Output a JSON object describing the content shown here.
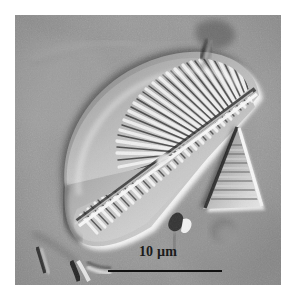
{
  "figure": {
    "kind": "light-microscopy-micrograph",
    "technique": "differential-interference-contrast",
    "width_px": 292,
    "height_px": 298,
    "background_color": "#ffffff",
    "field": {
      "left_px": 15,
      "top_px": 15,
      "width_px": 266,
      "height_px": 270,
      "base_gray": "#969696",
      "highlight_color": "#f2f2f2",
      "shadow_color": "#242424"
    }
  },
  "scalebar": {
    "label": "10 µm",
    "value": 10,
    "unit": "µm",
    "line_length_px": 114,
    "line_thickness_px": 2,
    "line_color": "#111111",
    "text_color": "#1b1b1b"
  },
  "specimens": [
    {
      "name": "primary-diatom-valve",
      "description": "Large triangular to lunate diatom valve in oblique view with radiating transapical striae",
      "striae_upper_count": 30,
      "striae_lower_count": 30,
      "features": [
        "raphe-sternum",
        "transapical-striae",
        "silica-rim",
        "apical-axis"
      ]
    },
    {
      "name": "secondary-diatom-fragment",
      "description": "Smaller triangular diatom fragment at right of field",
      "striae_count": 10
    }
  ],
  "debris": [
    {
      "name": "debris-top-blob",
      "description": "Dark irregular aggregate at top of field"
    },
    {
      "name": "debris-lower-left",
      "description": "Elongate dark fragments lower left"
    },
    {
      "name": "debris-lower-center",
      "description": "Small bright-dark fragment below valve"
    },
    {
      "name": "debris-dark-disc",
      "description": "Soft dark disc right of centre-bottom"
    }
  ]
}
